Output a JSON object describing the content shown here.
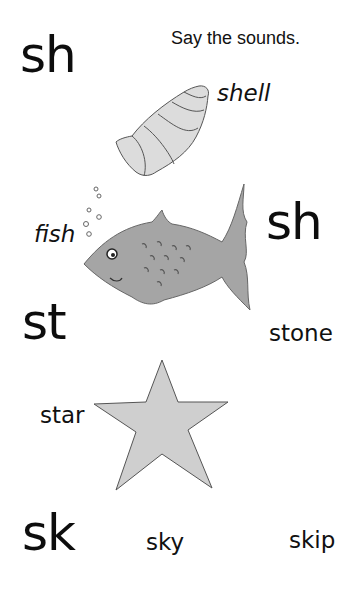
{
  "page": {
    "instruction": "Say the sounds.",
    "sections": [
      {
        "digraph": "sh",
        "words": [
          "shell",
          "fish"
        ],
        "repeat_digraph": "sh"
      },
      {
        "digraph": "st",
        "words": [
          "stone",
          "star"
        ]
      },
      {
        "digraph": "sk",
        "words": [
          "sky",
          "skip"
        ]
      }
    ],
    "illustrations": [
      {
        "name": "shell-illustration",
        "color": "#d9d9d9"
      },
      {
        "name": "fish-illustration",
        "color": "#9e9e9e"
      },
      {
        "name": "star-illustration",
        "color": "#cfcfcf"
      }
    ]
  }
}
